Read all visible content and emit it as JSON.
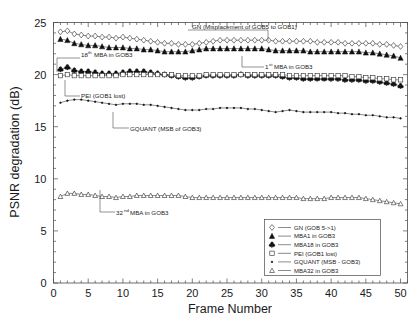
{
  "chart_data": {
    "type": "line",
    "title": "",
    "xlabel": "Frame Number",
    "ylabel": "PSNR degradation (dB)",
    "xlim": [
      0,
      51
    ],
    "ylim": [
      0,
      25
    ],
    "xticks": [
      0,
      5,
      10,
      15,
      20,
      25,
      30,
      35,
      40,
      45,
      50
    ],
    "yticks": [
      0,
      5,
      10,
      15,
      20,
      25
    ],
    "grid": false,
    "legend_position": "lower-right",
    "x": [
      1,
      2,
      3,
      4,
      5,
      6,
      7,
      8,
      9,
      10,
      11,
      12,
      13,
      14,
      15,
      16,
      17,
      18,
      19,
      20,
      21,
      22,
      23,
      24,
      25,
      26,
      27,
      28,
      29,
      30,
      31,
      32,
      33,
      34,
      35,
      36,
      37,
      38,
      39,
      40,
      41,
      42,
      43,
      44,
      45,
      46,
      47,
      48,
      49,
      50
    ],
    "series": [
      {
        "name": "GN (GOB 5->1)",
        "marker": "open-diamond",
        "values": [
          24.1,
          24.2,
          23.9,
          23.8,
          23.7,
          23.7,
          23.6,
          23.6,
          23.5,
          23.6,
          23.5,
          23.4,
          23.3,
          23.2,
          23.1,
          23.0,
          23.0,
          22.9,
          22.9,
          22.9,
          23.0,
          23.1,
          23.2,
          23.3,
          23.3,
          23.3,
          23.3,
          23.3,
          23.3,
          23.3,
          23.3,
          23.2,
          23.2,
          23.2,
          23.2,
          23.2,
          23.2,
          23.1,
          23.1,
          23.1,
          23.1,
          23.0,
          23.0,
          23.0,
          23.0,
          23.0,
          22.9,
          22.9,
          22.8,
          22.7
        ]
      },
      {
        "name": "MBA1 in GOB3",
        "marker": "filled-triangle",
        "values": [
          23.4,
          23.3,
          23.0,
          22.9,
          22.8,
          22.8,
          22.7,
          22.6,
          22.6,
          22.6,
          22.5,
          22.5,
          22.4,
          22.4,
          22.3,
          22.2,
          22.2,
          22.2,
          22.2,
          22.3,
          22.4,
          22.5,
          22.5,
          22.5,
          22.5,
          22.5,
          22.5,
          22.5,
          22.5,
          22.5,
          22.4,
          22.3,
          22.3,
          22.3,
          22.3,
          22.3,
          22.2,
          22.2,
          22.2,
          22.2,
          22.2,
          22.2,
          22.2,
          22.2,
          22.1,
          22.1,
          22.0,
          21.9,
          21.8,
          21.6
        ]
      },
      {
        "name": "MBA18 in GOB3",
        "marker": "filled-club",
        "values": [
          20.5,
          20.7,
          20.4,
          20.3,
          20.3,
          20.2,
          20.1,
          20.1,
          20.1,
          20.2,
          20.3,
          20.3,
          20.3,
          20.2,
          20.1,
          20.0,
          19.9,
          19.8,
          19.7,
          19.7,
          19.8,
          19.9,
          19.9,
          19.9,
          19.9,
          19.9,
          20.0,
          19.9,
          19.9,
          19.9,
          19.9,
          19.9,
          19.8,
          19.7,
          19.7,
          19.6,
          19.6,
          19.6,
          19.6,
          19.6,
          19.6,
          19.5,
          19.5,
          19.5,
          19.4,
          19.4,
          19.3,
          19.2,
          19.1,
          18.9
        ]
      },
      {
        "name": "PEI (GOB1 lost)",
        "marker": "open-square",
        "values": [
          19.9,
          20.0,
          19.9,
          19.9,
          19.9,
          19.9,
          19.9,
          19.9,
          19.9,
          20.0,
          20.0,
          20.0,
          20.0,
          20.0,
          20.0,
          20.0,
          20.0,
          19.9,
          19.9,
          19.9,
          19.9,
          20.0,
          20.0,
          20.0,
          20.0,
          20.0,
          20.0,
          20.0,
          20.0,
          20.0,
          20.0,
          20.0,
          20.0,
          19.9,
          19.9,
          19.9,
          19.9,
          19.9,
          19.9,
          19.9,
          19.9,
          19.9,
          19.8,
          19.8,
          19.7,
          19.7,
          19.6,
          19.6,
          19.5,
          19.5
        ]
      },
      {
        "name": "GQUANT (MSB - GOB3)",
        "marker": "small-star",
        "values": [
          17.3,
          17.5,
          17.6,
          17.6,
          17.5,
          17.4,
          17.3,
          17.2,
          17.1,
          17.2,
          17.2,
          17.2,
          17.1,
          17.1,
          17.0,
          16.9,
          16.8,
          16.7,
          16.6,
          16.6,
          16.6,
          16.7,
          16.7,
          16.8,
          16.8,
          16.8,
          16.8,
          16.7,
          16.7,
          16.6,
          16.5,
          16.4,
          16.5,
          16.6,
          16.5,
          16.4,
          16.4,
          16.4,
          16.4,
          16.4,
          16.3,
          16.3,
          16.2,
          16.2,
          16.1,
          16.1,
          16.0,
          15.9,
          15.9,
          15.8
        ]
      },
      {
        "name": "MBA32 in GOB3",
        "marker": "open-triangle",
        "values": [
          8.3,
          8.6,
          8.6,
          8.5,
          8.5,
          8.4,
          8.3,
          8.3,
          8.2,
          8.3,
          8.3,
          8.4,
          8.4,
          8.4,
          8.4,
          8.4,
          8.4,
          8.4,
          8.3,
          8.2,
          8.2,
          8.2,
          8.2,
          8.2,
          8.2,
          8.2,
          8.2,
          8.2,
          8.2,
          8.2,
          8.2,
          8.2,
          8.2,
          8.2,
          8.2,
          8.1,
          8.1,
          8.1,
          8.1,
          8.2,
          8.2,
          8.2,
          8.2,
          8.2,
          8.1,
          8.0,
          7.9,
          7.8,
          7.7,
          7.6
        ]
      }
    ],
    "annotations": [
      {
        "id": "gn",
        "text": "GN (Misplacement of GOB5 to GOB1)",
        "sup": ""
      },
      {
        "id": "mba18",
        "text": " MBA in GOB3",
        "prefix": "18",
        "sup": "th"
      },
      {
        "id": "mba1",
        "text": " MBA in GOB3",
        "prefix": "1",
        "sup": "st"
      },
      {
        "id": "pei",
        "text": "PEI (GOB1 lost)",
        "sup": ""
      },
      {
        "id": "gquant",
        "text": "GQUANT (MSB of GOB3)",
        "sup": ""
      },
      {
        "id": "mba32",
        "text": " MBA in GOB3",
        "prefix": "32",
        "sup": "nd"
      }
    ]
  },
  "axes": {
    "ylabel": "PSNR degradation (dB)",
    "xlabel": "Frame Number",
    "yticks": [
      "0",
      "5",
      "10",
      "15",
      "20",
      "25"
    ],
    "xticks": [
      "0",
      "5",
      "10",
      "15",
      "20",
      "25",
      "30",
      "35",
      "40",
      "45",
      "50"
    ]
  },
  "legend": {
    "entries": [
      {
        "label": "GN (GOB 5->1)"
      },
      {
        "label": "MBA1 in GOB3"
      },
      {
        "label": "MBA18 in GOB3"
      },
      {
        "label": "PEI (GOB1 lost)"
      },
      {
        "label": "GQUANT (MSB - GOB3)"
      },
      {
        "label": "MBA32 in GOB3"
      }
    ]
  },
  "annotations": {
    "gn": "GN (Misplacement of GOB5 to GOB1)",
    "mba18_prefix": "18",
    "mba18_sup": "th",
    "mba18_rest": " MBA in GOB3",
    "mba1_prefix": "1",
    "mba1_sup": "st",
    "mba1_rest": " MBA in GOB3",
    "pei": "PEI (GOB1 lost)",
    "gquant": "GQUANT (MSB of GOB3)",
    "mba32_prefix": "32",
    "mba32_sup": "nd",
    "mba32_rest": " MBA in GOB3"
  },
  "colors": {
    "line": "#2a2a2a",
    "frame": "#4a4a4a",
    "background": "#ffffff",
    "text": "#1a1a1a"
  }
}
